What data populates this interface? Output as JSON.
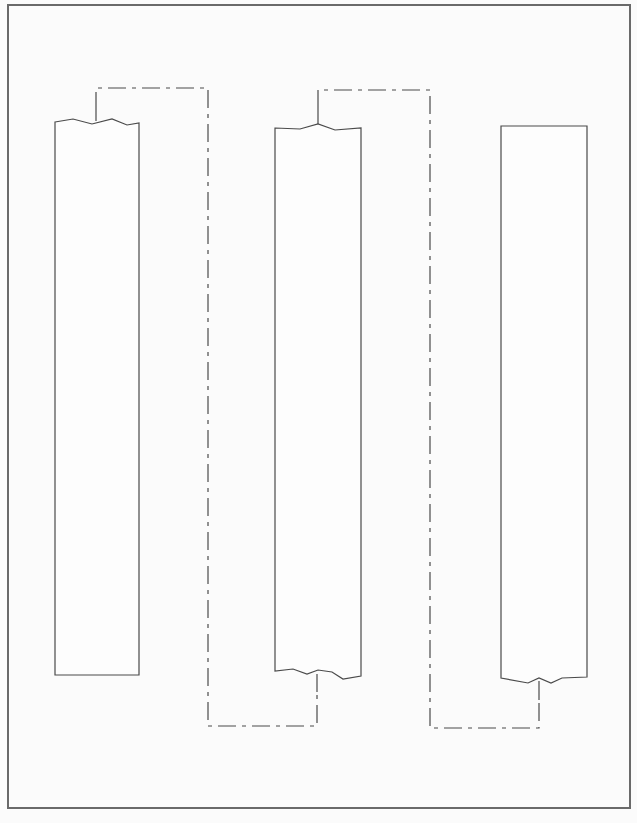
{
  "figure": {
    "type": "line-drawing",
    "colors": {
      "background": "#fbfbfb",
      "line": "#4a4a4a",
      "frame": "#6a6a6a"
    },
    "frame": {
      "x": 8,
      "y": 5,
      "width": 622,
      "height": 803
    },
    "strips": [
      {
        "id": "strip-left",
        "x1": 55,
        "x2": 139,
        "top_edge": "wavy",
        "top_y": 122,
        "bottom_edge": "straight",
        "bottom_y": 675
      },
      {
        "id": "strip-middle",
        "x1": 275,
        "x2": 361,
        "top_edge": "wavy",
        "top_y": 124,
        "bottom_edge": "wavy",
        "bottom_y": 674
      },
      {
        "id": "strip-right",
        "x1": 501,
        "x2": 587,
        "top_edge": "straight",
        "top_y": 126,
        "bottom_edge": "wavy",
        "bottom_y": 680
      }
    ],
    "connectors": [
      {
        "id": "connector-1",
        "style": "dash-dot",
        "from": "strip-left top",
        "to": "strip-middle bottom",
        "points": [
          [
            96,
            120
          ],
          [
            96,
            88
          ],
          [
            208,
            88
          ],
          [
            208,
            726
          ],
          [
            317,
            726
          ],
          [
            317,
            676
          ]
        ]
      },
      {
        "id": "connector-2",
        "style": "dash-dot",
        "from": "strip-middle top",
        "to": "strip-right bottom",
        "points": [
          [
            318,
            124
          ],
          [
            318,
            90
          ],
          [
            430,
            90
          ],
          [
            430,
            728
          ],
          [
            539,
            728
          ],
          [
            539,
            683
          ]
        ]
      }
    ]
  },
  "caption": {
    "text": "",
    "visible": "partially cut off at bottom edge"
  }
}
